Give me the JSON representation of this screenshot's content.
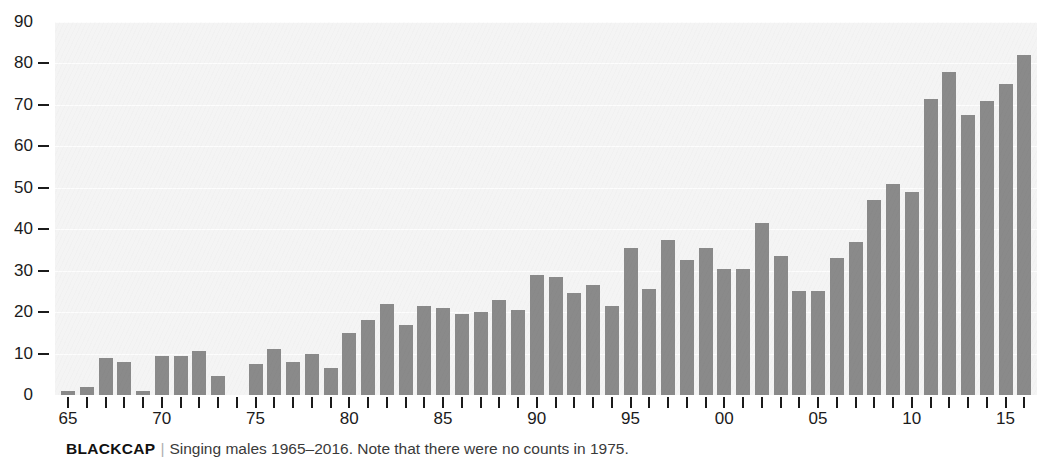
{
  "caption": {
    "species": "BLACKCAP",
    "separator": "|",
    "text": "Singing males 1965–2016. Note that there were no counts in 1975."
  },
  "colors": {
    "bar": "#8a8a8a",
    "plot_background": "#f4f4f4",
    "gridline": "#fdfdfd",
    "axis_text": "#1b1b1b",
    "caption_text": "#3a3a3a"
  },
  "chart_data": {
    "type": "bar",
    "title": "BLACKCAP",
    "subtitle": "Singing males 1965–2016. Note that there were no counts in 1975.",
    "xlabel": "",
    "ylabel": "",
    "ylim": [
      0,
      90
    ],
    "ytick_values": [
      0,
      10,
      20,
      30,
      40,
      50,
      60,
      70,
      80,
      90
    ],
    "ytick_labels": [
      "0",
      "10",
      "20",
      "30",
      "40",
      "50",
      "60",
      "70",
      "80",
      "90"
    ],
    "grid": true,
    "legend": false,
    "xtick_years": [
      1965,
      1970,
      1975,
      1980,
      1985,
      1990,
      1995,
      2000,
      2005,
      2010,
      2015
    ],
    "xtick_labels": [
      "65",
      "70",
      "75",
      "80",
      "85",
      "90",
      "95",
      "00",
      "05",
      "10",
      "15"
    ],
    "missing_years": [
      1975
    ],
    "categories": [
      "1965",
      "1966",
      "1967",
      "1968",
      "1969",
      "1970",
      "1971",
      "1972",
      "1973",
      "1974",
      "1975",
      "1976",
      "1977",
      "1978",
      "1979",
      "1980",
      "1981",
      "1982",
      "1983",
      "1984",
      "1985",
      "1986",
      "1987",
      "1988",
      "1989",
      "1990",
      "1991",
      "1992",
      "1993",
      "1994",
      "1995",
      "1996",
      "1997",
      "1998",
      "1999",
      "2000",
      "2001",
      "2002",
      "2003",
      "2004",
      "2005",
      "2006",
      "2007",
      "2008",
      "2009",
      "2010",
      "2011",
      "2012",
      "2013",
      "2014",
      "2015",
      "2016"
    ],
    "values": [
      1,
      2,
      9,
      8,
      1,
      9.5,
      9.5,
      10.5,
      4.5,
      null,
      7.5,
      11,
      8,
      10,
      6.5,
      15,
      18,
      22,
      17,
      21.5,
      21,
      19.5,
      20,
      23,
      20.5,
      29,
      28.5,
      24.5,
      26.5,
      21.5,
      35.5,
      25.5,
      37.5,
      32.5,
      35.5,
      30.5,
      30.5,
      41.5,
      33.5,
      25,
      25,
      33,
      37,
      47,
      51,
      49,
      71.5,
      78,
      67.5,
      71,
      75,
      82
    ]
  }
}
